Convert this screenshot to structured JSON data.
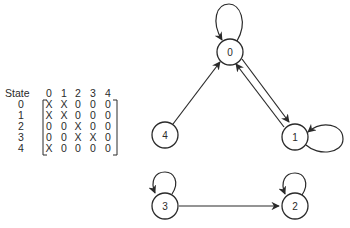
{
  "matrix": {
    "header_label": "State",
    "column_headers": [
      "0",
      "1",
      "2",
      "3",
      "4"
    ],
    "rows": [
      {
        "state": "0",
        "cells": [
          "X",
          "X",
          "0",
          "0",
          "0"
        ]
      },
      {
        "state": "1",
        "cells": [
          "X",
          "X",
          "0",
          "0",
          "0"
        ]
      },
      {
        "state": "2",
        "cells": [
          "0",
          "0",
          "X",
          "0",
          "0"
        ]
      },
      {
        "state": "3",
        "cells": [
          "0",
          "0",
          "X",
          "X",
          "0"
        ]
      },
      {
        "state": "4",
        "cells": [
          "X",
          "0",
          "0",
          "0",
          "0"
        ]
      }
    ]
  },
  "graph": {
    "nodes": [
      {
        "id": "0",
        "label": "0"
      },
      {
        "id": "1",
        "label": "1"
      },
      {
        "id": "2",
        "label": "2"
      },
      {
        "id": "3",
        "label": "3"
      },
      {
        "id": "4",
        "label": "4"
      }
    ],
    "edges": [
      {
        "from": "0",
        "to": "0",
        "type": "self-loop"
      },
      {
        "from": "0",
        "to": "1",
        "type": "directed"
      },
      {
        "from": "1",
        "to": "0",
        "type": "directed"
      },
      {
        "from": "1",
        "to": "1",
        "type": "self-loop"
      },
      {
        "from": "4",
        "to": "0",
        "type": "directed"
      },
      {
        "from": "2",
        "to": "2",
        "type": "self-loop"
      },
      {
        "from": "3",
        "to": "3",
        "type": "self-loop"
      },
      {
        "from": "3",
        "to": "2",
        "type": "directed"
      }
    ]
  },
  "colors": {
    "ink": "#2a2a2a",
    "background": "#ffffff"
  }
}
